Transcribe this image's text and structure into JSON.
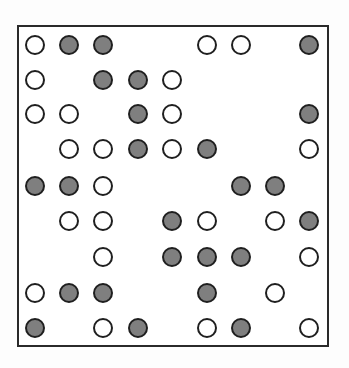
{
  "diagram": {
    "type": "dot-grid",
    "rows": 9,
    "cols": 9,
    "colors": {
      "frame": "#2a2a2a",
      "filled": "#7f7f7f",
      "open": "#ffffff",
      "stroke": "#1f1f1f"
    },
    "grid": [
      [
        "open",
        "filled",
        "filled",
        "",
        "",
        "open",
        "open",
        "",
        "filled"
      ],
      [
        "open",
        "",
        "filled",
        "filled",
        "open",
        "",
        "",
        "",
        ""
      ],
      [
        "open",
        "open",
        "",
        "filled",
        "open",
        "",
        "",
        "",
        "filled"
      ],
      [
        "",
        "open",
        "open",
        "filled",
        "open",
        "filled",
        "",
        "",
        "open"
      ],
      [
        "filled",
        "filled",
        "open",
        "",
        "",
        "",
        "filled",
        "filled",
        ""
      ],
      [
        "",
        "open",
        "open",
        "",
        "filled",
        "open",
        "",
        "open",
        "filled"
      ],
      [
        "",
        "",
        "open",
        "",
        "filled",
        "filled",
        "filled",
        "",
        "open"
      ],
      [
        "open",
        "filled",
        "filled",
        "",
        "",
        "filled",
        "",
        "open",
        ""
      ],
      [
        "filled",
        "",
        "open",
        "filled",
        "",
        "open",
        "filled",
        "",
        "open"
      ]
    ]
  },
  "layout": {
    "col_x": [
      35,
      69,
      103,
      138,
      172,
      207,
      241,
      275,
      309
    ],
    "row_y": [
      45,
      80,
      114,
      149,
      186,
      221,
      257,
      293,
      328
    ]
  }
}
